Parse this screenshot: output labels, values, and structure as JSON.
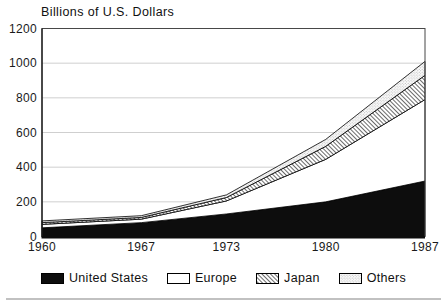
{
  "title": "Billions of U.S. Dollars",
  "chart_data": {
    "type": "area",
    "stacked": true,
    "title": "Billions of U.S. Dollars",
    "categories": [
      "1960",
      "1967",
      "1973",
      "1980",
      "1987"
    ],
    "x_years": [
      1960,
      1967,
      1973,
      1980,
      1987
    ],
    "series": [
      {
        "name": "United States",
        "values": [
          50,
          80,
          130,
          200,
          320
        ],
        "style": "solid-black"
      },
      {
        "name": "Europe",
        "values": [
          20,
          20,
          75,
          245,
          470
        ],
        "style": "white"
      },
      {
        "name": "Japan",
        "values": [
          10,
          10,
          20,
          75,
          140
        ],
        "style": "diagonal-hatch"
      },
      {
        "name": "Others",
        "values": [
          10,
          10,
          15,
          40,
          80
        ],
        "style": "light-stipple"
      }
    ],
    "stack_totals": [
      90,
      120,
      240,
      560,
      1010
    ],
    "xlabel": "",
    "ylabel": "",
    "ylim": [
      0,
      1200
    ],
    "yticks": [
      0,
      200,
      400,
      600,
      800,
      1000,
      1200
    ],
    "grid": true,
    "legend_position": "bottom"
  },
  "colors": {
    "series_black": "#0d0d0d",
    "series_white": "#ffffff",
    "hatch_line": "#2b2b2b",
    "stipple_dot": "#999999",
    "gridline": "#c9c9c9",
    "frame": "#474747",
    "axis": "#0d0d0d",
    "text": "#1a1a1a",
    "background": "#ffffff"
  }
}
